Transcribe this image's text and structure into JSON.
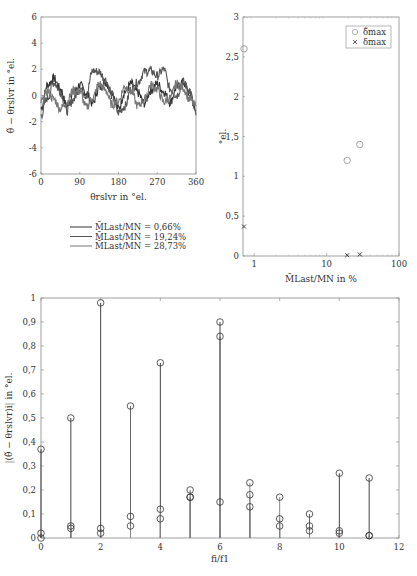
{
  "chart_data": [
    {
      "type": "line",
      "title": "",
      "xlabel": "θ_rslvr in °_el.",
      "ylabel": "θ̃ − θ_rslvr in °_el.",
      "xlim": [
        0,
        360
      ],
      "ylim": [
        -6,
        6
      ],
      "xticks": [
        0,
        90,
        180,
        270,
        360
      ],
      "yticks": [
        -6,
        -4,
        -2,
        0,
        2,
        4,
        6
      ],
      "grid": false,
      "legend_position": "below",
      "series": [
        {
          "name": "M̄_Last/M_N = 0,66%",
          "color": "#333333",
          "x": [
            0,
            15,
            30,
            45,
            60,
            75,
            90,
            105,
            120,
            135,
            150,
            165,
            180,
            195,
            210,
            225,
            240,
            255,
            270,
            285,
            300,
            315,
            330,
            345,
            360
          ],
          "y": [
            -1.0,
            0.8,
            1.3,
            0.5,
            -0.8,
            0.2,
            0.8,
            0.2,
            -0.6,
            0.6,
            1.0,
            0.3,
            -1.0,
            0.3,
            0.9,
            0.2,
            -0.6,
            0.4,
            0.9,
            0.3,
            -0.5,
            0.6,
            1.0,
            0.2,
            -1.2
          ]
        },
        {
          "name": "M̄_Last/M_N = 19,24%",
          "color": "#555555",
          "x": [
            0,
            15,
            30,
            45,
            60,
            75,
            90,
            105,
            120,
            135,
            150,
            165,
            180,
            195,
            210,
            225,
            240,
            255,
            270,
            285,
            300,
            315,
            330,
            345,
            360
          ],
          "y": [
            -1.5,
            -0.2,
            1.0,
            0.3,
            -1.2,
            -0.3,
            0.6,
            0.0,
            1.9,
            1.8,
            1.2,
            0.0,
            -1.3,
            -0.8,
            0.5,
            1.0,
            1.8,
            1.9,
            1.5,
            2.0,
            0.5,
            0.0,
            1.0,
            0.4,
            -1.5
          ]
        },
        {
          "name": "M̄_Last/M_N = 28,73%",
          "color": "#777777",
          "x": [
            0,
            15,
            30,
            45,
            60,
            75,
            90,
            105,
            120,
            135,
            150,
            165,
            180,
            195,
            210,
            225,
            240,
            255,
            270,
            285,
            300,
            315,
            330,
            345,
            360
          ],
          "y": [
            -0.5,
            0.3,
            -0.3,
            -1.0,
            -0.5,
            0.4,
            0.3,
            -0.9,
            -0.2,
            0.9,
            0.4,
            -0.7,
            -0.4,
            0.7,
            0.3,
            -0.8,
            -0.3,
            0.8,
            0.5,
            -0.5,
            -0.2,
            0.9,
            0.6,
            -0.3,
            -0.8
          ]
        }
      ]
    },
    {
      "type": "scatter",
      "xlabel": "M̄_Last/M_N in %",
      "ylabel": "°_el.",
      "xscale": "log",
      "xlim": [
        0.7,
        100
      ],
      "ylim": [
        0,
        3
      ],
      "xticks": [
        1,
        10,
        100
      ],
      "yticks": [
        "0",
        "0,5",
        "1",
        "1,5",
        "2",
        "2,5",
        "3"
      ],
      "grid": false,
      "legend_position": "upper right",
      "series": [
        {
          "name": "δ̃_max",
          "marker": "circle",
          "color": "#999999",
          "x": [
            0.66,
            19.24,
            28.73
          ],
          "y": [
            2.6,
            1.2,
            1.4
          ]
        },
        {
          "name": "δ_max",
          "marker": "x",
          "color": "#333333",
          "x": [
            0.66,
            19.24,
            28.73
          ],
          "y": [
            0.37,
            0.01,
            0.02
          ]
        }
      ]
    },
    {
      "type": "stem",
      "xlabel": "f_i / f_1",
      "ylabel": "|(θ̃ − θ_rslvr)_i| in °_el.",
      "xlim": [
        0,
        12
      ],
      "ylim": [
        0,
        1
      ],
      "xticks": [
        0,
        2,
        4,
        6,
        8,
        10,
        12
      ],
      "yticks": [
        "0",
        "0,1",
        "0,2",
        "0,3",
        "0,4",
        "0,5",
        "0,6",
        "0,7",
        "0,8",
        "0,9",
        "1"
      ],
      "grid": false,
      "categories": [
        0,
        1,
        2,
        3,
        4,
        5,
        6,
        7,
        8,
        9,
        10,
        11
      ],
      "series": [
        {
          "name": "0,66%",
          "values": [
            0.37,
            0.5,
            0.98,
            0.09,
            0.73,
            0.17,
            0.9,
            0.13,
            0.08,
            0.05,
            0.27,
            0.25
          ]
        },
        {
          "name": "19,24%",
          "values": [
            0.02,
            0.04,
            0.04,
            0.55,
            0.08,
            0.2,
            0.84,
            0.18,
            0.05,
            0.1,
            0.02,
            0.01
          ]
        },
        {
          "name": "28,73%",
          "values": [
            0.0,
            0.05,
            0.02,
            0.05,
            0.12,
            0.17,
            0.15,
            0.23,
            0.17,
            0.03,
            0.03,
            0.01
          ]
        }
      ]
    }
  ],
  "labels": {
    "p1_xlabel_main": "θ",
    "p1_xlabel_sub": "rslvr",
    "p1_xlabel_unit": "in °",
    "p1_xlabel_unit_sub": "el.",
    "p1_ylabel": "θ̃ − θrslvr in °el.",
    "p2_xlabel": "M̄Last/MN in %",
    "p2_ylabel": "°el.",
    "p2_legend": [
      "δ̃max",
      "δmax"
    ],
    "p3_xlabel": "fi/f1",
    "p3_ylabel": "|(θ̃ − θrslvr)i| in °el.",
    "legend": [
      "M̄Last/MN = 0,66%",
      "M̄Last/MN = 19,24%",
      "M̄Last/MN = 28,73%"
    ]
  }
}
